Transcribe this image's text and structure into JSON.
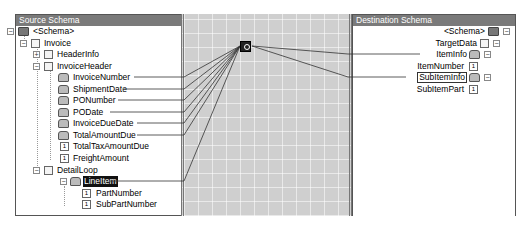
{
  "source_panel": {
    "title": "Source Schema",
    "nodes": [
      {
        "label": "<Schema>",
        "icon": "folder-icon",
        "expander": "−"
      },
      {
        "label": "Invoice",
        "icon": "document-icon",
        "expander": "−"
      },
      {
        "label": "HeaderInfo",
        "icon": "document-icon",
        "expander": "+"
      },
      {
        "label": "InvoiceHeader",
        "icon": "document-icon",
        "expander": "−"
      },
      {
        "label": "InvoiceNumber",
        "icon": "record-icon",
        "linked": true
      },
      {
        "label": "ShipmentDate",
        "icon": "record-icon",
        "linked": true
      },
      {
        "label": "PONumber",
        "icon": "record-icon",
        "linked": true
      },
      {
        "label": "PODate",
        "icon": "record-icon",
        "linked": true
      },
      {
        "label": "InvoiceDueDate",
        "icon": "record-icon",
        "linked": true
      },
      {
        "label": "TotalAmountDue",
        "icon": "record-icon",
        "linked": true
      },
      {
        "label": "TotalTaxAmountDue",
        "icon": "field-icon"
      },
      {
        "label": "FreightAmount",
        "icon": "field-icon"
      },
      {
        "label": "DetailLoop",
        "icon": "document-icon",
        "expander": "−"
      },
      {
        "label": "LineItem",
        "icon": "record-icon",
        "expander": "−",
        "selected": true,
        "linked": true
      },
      {
        "label": "PartNumber",
        "icon": "field-icon"
      },
      {
        "label": "SubPartNumber",
        "icon": "field-icon"
      }
    ]
  },
  "destination_panel": {
    "title": "Destination Schema",
    "nodes": [
      {
        "label": "<Schema>",
        "icon": "folder-icon",
        "expander": "−"
      },
      {
        "label": "TargetData",
        "icon": "document-icon",
        "expander": "−"
      },
      {
        "label": "ItemInfo",
        "icon": "record-icon",
        "expander": "−",
        "linked": true
      },
      {
        "label": "ItemNumber",
        "icon": "field-icon"
      },
      {
        "label": "SubItemInfo",
        "icon": "record-icon",
        "expander": "−",
        "boxed": true,
        "linked": true
      },
      {
        "label": "SubItemPart",
        "icon": "field-icon"
      }
    ]
  },
  "grid": {
    "functoid": {
      "name": "looping-functoid"
    }
  },
  "colors": {
    "header_bg": "#7a7a7a",
    "grid_bg": "#cfcfcf",
    "link_line": "#333333"
  }
}
